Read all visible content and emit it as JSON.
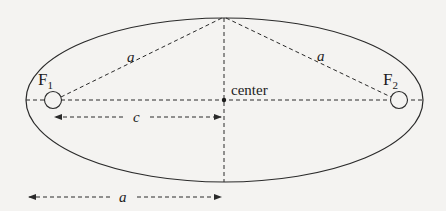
{
  "colors": {
    "background": "#f4f3f1",
    "stroke": "#2a2a2a",
    "text": "#1c1c1c"
  },
  "ellipse": {
    "cx": 224.5,
    "cy": 100,
    "rx": 198.5,
    "ry": 82
  },
  "foci": [
    {
      "id": "F1",
      "label": "F",
      "subscript": "1",
      "cx": 53,
      "cy": 100,
      "r": 8.5
    },
    {
      "id": "F2",
      "label": "F",
      "subscript": "2",
      "cx": 399,
      "cy": 100,
      "r": 8.5
    }
  ],
  "center": {
    "label": "center",
    "x": 224,
    "y": 100
  },
  "labels": {
    "a_left_segment": "a",
    "a_right_segment": "a",
    "c_arrow": "c",
    "a_arrow": "a",
    "f1_main": "F",
    "f1_sub": "1",
    "f2_main": "F",
    "f2_sub": "2",
    "center": "center"
  },
  "dimension_arrows": [
    {
      "name": "c",
      "label": "c",
      "x1": 54,
      "x2": 222,
      "y": 117
    },
    {
      "name": "a",
      "label": "a",
      "x1": 28,
      "x2": 222,
      "y": 197
    }
  ]
}
